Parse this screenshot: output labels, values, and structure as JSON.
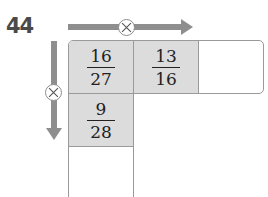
{
  "problem": {
    "number": "44",
    "operation_symbol": "×",
    "operation_icon": "multiply-circle-icon",
    "arrow_color": "#8e8e8e",
    "cell_shade_color": "#dcdcdc"
  },
  "grid": {
    "top_row": [
      {
        "numerator": "16",
        "denominator": "27",
        "shaded": true
      },
      {
        "numerator": "13",
        "denominator": "16",
        "shaded": true
      },
      {
        "numerator": "",
        "denominator": "",
        "shaded": false,
        "blank": true
      }
    ],
    "left_column": [
      {
        "numerator": "9",
        "denominator": "28",
        "shaded": true
      },
      {
        "numerator": "",
        "denominator": "",
        "shaded": false,
        "blank": true
      }
    ]
  }
}
